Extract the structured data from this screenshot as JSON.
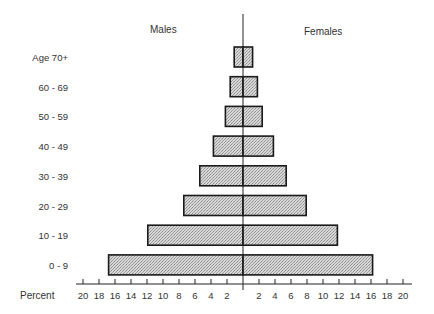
{
  "chart_data": {
    "type": "bar",
    "orientation": "horizontal",
    "subtype": "population-pyramid",
    "title": "",
    "xlabel": "Percent",
    "ylabel": "",
    "side_labels": {
      "left": "Males",
      "right": "Females"
    },
    "categories": [
      "Age 70+",
      "60 - 69",
      "50 - 59",
      "40 - 49",
      "30 - 39",
      "20 - 29",
      "10 - 19",
      "0 - 9"
    ],
    "series": [
      {
        "name": "Males",
        "values": [
          1.1,
          1.6,
          2.2,
          3.7,
          5.4,
          7.4,
          11.9,
          16.8
        ]
      },
      {
        "name": "Females",
        "values": [
          1.2,
          1.8,
          2.4,
          3.8,
          5.4,
          7.9,
          11.8,
          16.2
        ]
      }
    ],
    "x_ticks_left": [
      "20",
      "18",
      "16",
      "14",
      "12",
      "10",
      "8",
      "6",
      "4",
      "2"
    ],
    "x_ticks_right": [
      "2",
      "4",
      "6",
      "8",
      "10",
      "12",
      "14",
      "16",
      "18",
      "20"
    ],
    "xlim": [
      -20,
      20
    ],
    "grid": false,
    "legend": "none",
    "bar_fill": "#c6c6c6",
    "bar_stroke": "#1a1a1a"
  }
}
